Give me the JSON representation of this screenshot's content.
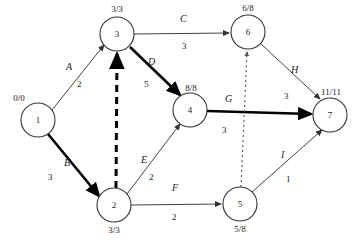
{
  "diagram": {
    "type": "activity-on-arc-network",
    "colors": {
      "node_stroke": "#333333",
      "node_fill": "#ffffff",
      "edge_normal": "#444444",
      "edge_critical": "#000000",
      "edge_dummy": "#555555",
      "text": "#1a1a1a"
    },
    "nodes": [
      {
        "key": "n1",
        "id": "1",
        "time": "0/0",
        "cx": 38,
        "cy": 120,
        "r": 17,
        "time_pos": "top-left"
      },
      {
        "key": "n2",
        "id": "2",
        "time": "3/3",
        "cx": 114,
        "cy": 205,
        "r": 17,
        "time_pos": "bottom"
      },
      {
        "key": "n3",
        "id": "3",
        "time": "3/3",
        "cx": 117,
        "cy": 34,
        "r": 17,
        "time_pos": "top"
      },
      {
        "key": "n4",
        "id": "4",
        "time": "8/8",
        "cx": 190,
        "cy": 110,
        "r": 17,
        "time_pos": "top-left"
      },
      {
        "key": "n5",
        "id": "5",
        "time": "5/8",
        "cx": 240,
        "cy": 204,
        "r": 17,
        "time_pos": "bottom"
      },
      {
        "key": "n6",
        "id": "6",
        "time": "6/8",
        "cx": 248,
        "cy": 32,
        "r": 17,
        "time_pos": "top"
      },
      {
        "key": "n7",
        "id": "7",
        "time": "11/11",
        "cx": 330,
        "cy": 115,
        "r": 17,
        "time_pos": "top-left"
      }
    ],
    "edges": [
      {
        "key": "e_A",
        "name": "A",
        "weight": "2",
        "from": "1",
        "to": "3",
        "style": "normal",
        "name_x": 66,
        "name_y": 62,
        "w_x": 77,
        "w_y": 80
      },
      {
        "key": "e_B",
        "name": "B",
        "weight": "3",
        "from": "1",
        "to": "2",
        "style": "critical",
        "name_x": 64,
        "name_y": 158,
        "w_x": 48,
        "w_y": 173
      },
      {
        "key": "e_C",
        "name": "C",
        "weight": "3",
        "from": "3",
        "to": "6",
        "style": "normal",
        "name_x": 180,
        "name_y": 14,
        "w_x": 182,
        "w_y": 42
      },
      {
        "key": "e_D",
        "name": "D",
        "weight": "5",
        "from": "3",
        "to": "4",
        "style": "critical",
        "name_x": 148,
        "name_y": 57,
        "w_x": 144,
        "w_y": 80
      },
      {
        "key": "e_E",
        "name": "E",
        "weight": "2",
        "from": "2",
        "to": "4",
        "style": "normal",
        "name_x": 141,
        "name_y": 155,
        "w_x": 149,
        "w_y": 173
      },
      {
        "key": "e_F",
        "name": "F",
        "weight": "2",
        "from": "2",
        "to": "5",
        "style": "normal",
        "name_x": 172,
        "name_y": 183,
        "w_x": 172,
        "w_y": 213
      },
      {
        "key": "e_G",
        "name": "G",
        "weight": "3",
        "from": "4",
        "to": "7",
        "style": "critical",
        "name_x": 225,
        "name_y": 94,
        "w_x": 222,
        "w_y": 126
      },
      {
        "key": "e_H",
        "name": "H",
        "weight": "3",
        "from": "6",
        "to": "7",
        "style": "normal",
        "name_x": 291,
        "name_y": 65,
        "w_x": 284,
        "w_y": 92
      },
      {
        "key": "e_I",
        "name": "I",
        "weight": "1",
        "from": "5",
        "to": "7",
        "style": "normal",
        "name_x": 281,
        "name_y": 150,
        "w_x": 286,
        "w_y": 175
      },
      {
        "key": "e_dummy_23",
        "name": "",
        "weight": "",
        "from": "2",
        "to": "3",
        "style": "dashed-thick",
        "name_x": 0,
        "name_y": 0,
        "w_x": 0,
        "w_y": 0
      },
      {
        "key": "e_dummy_56",
        "name": "",
        "weight": "",
        "from": "5",
        "to": "6",
        "style": "dotted",
        "name_x": 0,
        "name_y": 0,
        "w_x": 0,
        "w_y": 0
      }
    ]
  }
}
